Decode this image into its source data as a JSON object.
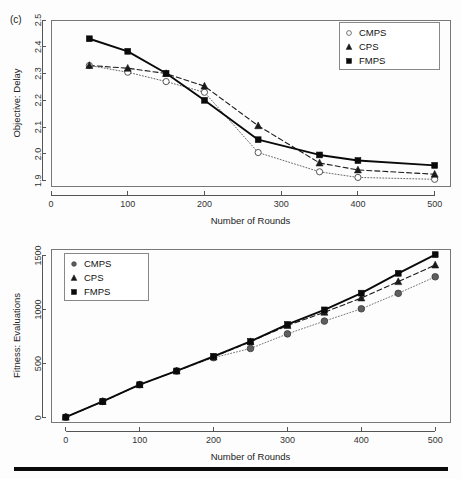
{
  "figure": {
    "panel_label": "(c)",
    "background": "#ffffff",
    "footer_rule_color": "#0a0a0a"
  },
  "chart_data": [
    {
      "id": "objective-delay",
      "type": "line",
      "title": "",
      "panel_label": "(c)",
      "xlabel": "Number of Rounds",
      "ylabel": "Objective: Delay",
      "xlim": [
        0,
        520
      ],
      "ylim": [
        1.88,
        2.5
      ],
      "xticks": [
        0,
        100,
        200,
        300,
        400,
        500
      ],
      "xtick_labels": [
        "0",
        "100",
        "200",
        "300",
        "400",
        "500"
      ],
      "yticks": [
        1.9,
        2.0,
        2.1,
        2.2,
        2.3,
        2.4,
        2.5
      ],
      "ytick_labels": [
        "1.9",
        "2.0",
        "2.1",
        "2.2",
        "2.3",
        "2.4",
        "2.5"
      ],
      "grid": false,
      "legend_position": "top-right",
      "series": [
        {
          "name": "CMPS",
          "marker": "open-circle",
          "color": "#666666",
          "dash": "1,2",
          "linewidth": 1,
          "x": [
            50,
            100,
            150,
            200,
            270,
            350,
            400,
            500
          ],
          "values": [
            2.33,
            2.305,
            2.27,
            2.23,
            2.005,
            1.933,
            1.912,
            1.905
          ]
        },
        {
          "name": "CPS",
          "marker": "triangle",
          "color": "#1a1a1a",
          "dash": "5,3",
          "linewidth": 1.1,
          "x": [
            50,
            100,
            150,
            200,
            270,
            350,
            400,
            500
          ],
          "values": [
            2.33,
            2.32,
            2.3,
            2.253,
            2.105,
            1.966,
            1.94,
            1.924
          ]
        },
        {
          "name": "FMPS",
          "marker": "square",
          "color": "#0a0a0a",
          "dash": "none",
          "linewidth": 1.9,
          "x": [
            50,
            100,
            150,
            200,
            270,
            350,
            400,
            500
          ],
          "values": [
            2.43,
            2.383,
            2.301,
            2.2,
            2.053,
            1.996,
            1.975,
            1.957
          ]
        }
      ]
    },
    {
      "id": "fitness-evaluations",
      "type": "line",
      "title": "",
      "xlabel": "Number of Rounds",
      "ylabel": "Fitness: Evaluations",
      "xlim": [
        -20,
        520
      ],
      "ylim": [
        -40,
        1560
      ],
      "xticks": [
        0,
        100,
        200,
        300,
        400,
        500
      ],
      "xtick_labels": [
        "0",
        "100",
        "200",
        "300",
        "400",
        "500"
      ],
      "yticks": [
        0,
        500,
        1000,
        1500
      ],
      "ytick_labels": [
        "0",
        "500",
        "1000",
        "1500"
      ],
      "grid": false,
      "legend_position": "top-left",
      "series": [
        {
          "name": "CMPS",
          "marker": "filled-circle",
          "color": "#777777",
          "dash": "1,2",
          "linewidth": 1,
          "x": [
            0,
            50,
            100,
            150,
            200,
            250,
            300,
            350,
            400,
            450,
            500
          ],
          "values": [
            5,
            150,
            305,
            432,
            555,
            640,
            775,
            893,
            1007,
            1150,
            1303
          ]
        },
        {
          "name": "CPS",
          "marker": "triangle",
          "color": "#1a1a1a",
          "dash": "5,3",
          "linewidth": 1.1,
          "x": [
            0,
            50,
            100,
            150,
            200,
            250,
            300,
            350,
            400,
            450,
            500
          ],
          "values": [
            5,
            150,
            305,
            432,
            562,
            703,
            852,
            975,
            1107,
            1258,
            1412
          ]
        },
        {
          "name": "FMPS",
          "marker": "square",
          "color": "#0a0a0a",
          "dash": "none",
          "linewidth": 1.9,
          "x": [
            0,
            50,
            100,
            150,
            200,
            250,
            300,
            350,
            400,
            450,
            500
          ],
          "values": [
            5,
            150,
            305,
            432,
            568,
            705,
            862,
            997,
            1152,
            1335,
            1508
          ]
        }
      ]
    }
  ]
}
